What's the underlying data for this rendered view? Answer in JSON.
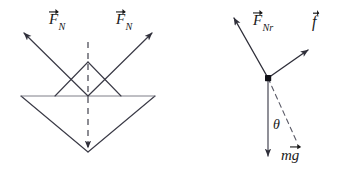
{
  "figure": {
    "background_color": "#ffffff",
    "stroke_color": "#3a3a46",
    "text_color": "#1a1a1a",
    "width": 345,
    "height": 176
  },
  "left_diagram": {
    "name": "v-groove-normal-forces",
    "description": "Symmetric V-groove cross-section with two normal force vectors",
    "labels": {
      "normal_force_left": {
        "base": "F",
        "subscript": "N",
        "vector": true,
        "text": "F⃗N"
      },
      "normal_force_right": {
        "base": "F",
        "subscript": "N",
        "vector": true,
        "text": "F⃗N"
      }
    },
    "center_line": {
      "style": "dashed",
      "orientation": "vertical"
    }
  },
  "right_diagram": {
    "name": "free-body-diagram",
    "description": "Free body diagram with normal force, friction and weight",
    "labels": {
      "normal_force": {
        "base": "F",
        "subscript": "Nr",
        "vector": true,
        "text": "F⃗Nr"
      },
      "friction_force": {
        "base": "f",
        "subscript": "",
        "vector": true,
        "text": "f⃗"
      },
      "weight": {
        "base": "mg",
        "subscript": "",
        "vector": true,
        "text": "mg⃗"
      },
      "angle": {
        "symbol": "θ",
        "text": "θ"
      }
    },
    "origin_marker": "filled-square-dot",
    "reference_line": {
      "style": "dashed"
    }
  }
}
